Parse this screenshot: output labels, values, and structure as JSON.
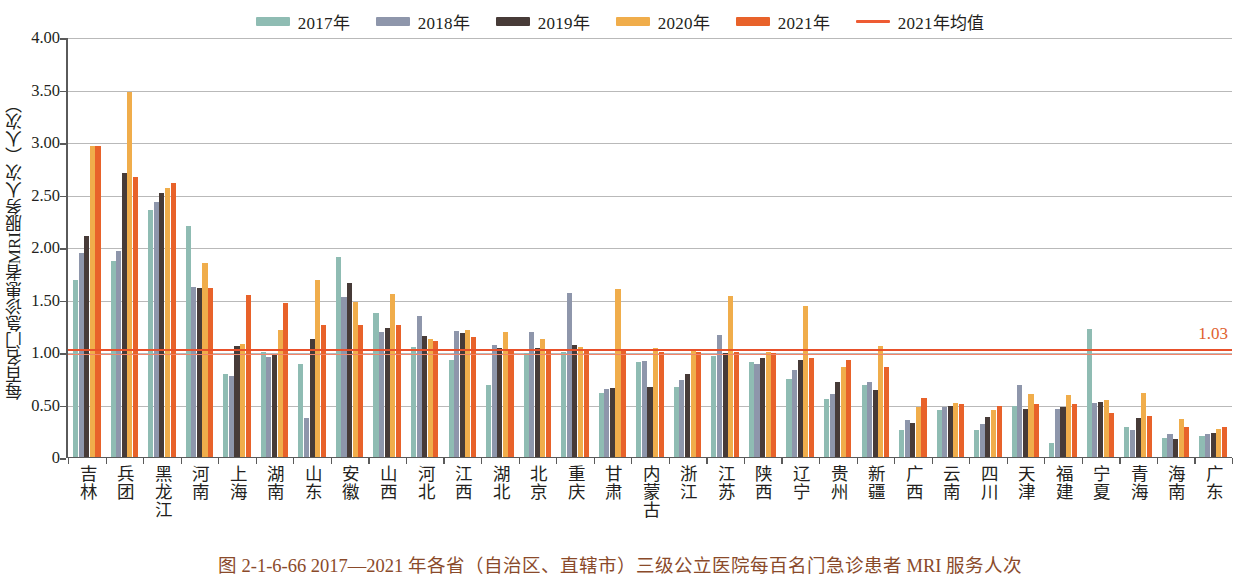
{
  "legend": {
    "items": [
      {
        "label": "2017年",
        "color": "#8fbcb3",
        "type": "bar"
      },
      {
        "label": "2018年",
        "color": "#8e96ab",
        "type": "bar"
      },
      {
        "label": "2019年",
        "color": "#473b38",
        "type": "bar"
      },
      {
        "label": "2020年",
        "color": "#f0ad4b",
        "type": "bar"
      },
      {
        "label": "2021年",
        "color": "#e8622a",
        "type": "bar"
      },
      {
        "label": "2021年均值",
        "color": "#ee5b33",
        "type": "line"
      }
    ]
  },
  "axes": {
    "y_title": "每百名门急诊患者MRI服务人次（人次）",
    "y_ticks": [
      "4.00",
      "3.50",
      "3.00",
      "2.50",
      "2.00",
      "1.50",
      "1.00",
      "0.50",
      "0"
    ],
    "y_min": 0,
    "y_max": 4.0,
    "grid": true
  },
  "average": {
    "value": 1.03,
    "label": "1.03",
    "color": "#e8502a"
  },
  "caption": {
    "text": "图 2-1-6-66   2017—2021 年各省（自治区、直辖市）三级公立医院每百名门急诊患者 MRI 服务人次"
  },
  "chart_data": {
    "type": "bar",
    "title": "图 2-1-6-66   2017—2021 年各省（自治区、直辖市）三级公立医院每百名门急诊患者 MRI 服务人次",
    "xlabel": "",
    "ylabel": "每百名门急诊患者MRI服务人次（人次）",
    "ylim": [
      0,
      4.0
    ],
    "ytick_step": 0.5,
    "grid": true,
    "legend_position": "top-center",
    "annotations": [
      {
        "text": "1.03",
        "type": "hline-label",
        "value": 1.03,
        "color": "#e8502a"
      }
    ],
    "categories": [
      "吉林",
      "兵团",
      "黑龙江",
      "河南",
      "上海",
      "湖南",
      "山东",
      "安徽",
      "山西",
      "河北",
      "江西",
      "湖北",
      "北京",
      "重庆",
      "甘肃",
      "内蒙古",
      "浙江",
      "江苏",
      "陕西",
      "辽宁",
      "贵州",
      "新疆",
      "广西",
      "云南",
      "四川",
      "天津",
      "福建",
      "宁夏",
      "青海",
      "海南",
      "广东"
    ],
    "series": [
      {
        "name": "2017年",
        "color": "#8fbcb3",
        "values": [
          1.7,
          1.88,
          2.36,
          2.21,
          0.8,
          1.01,
          0.9,
          1.91,
          1.38,
          1.06,
          0.93,
          0.7,
          1.0,
          1.01,
          0.62,
          0.91,
          0.68,
          0.97,
          0.91,
          0.75,
          0.56,
          0.7,
          0.27,
          0.46,
          0.27,
          0.5,
          0.14,
          1.23,
          0.3,
          0.19,
          0.21
        ]
      },
      {
        "name": "2018年",
        "color": "#8e96ab",
        "values": [
          1.95,
          1.97,
          2.44,
          1.63,
          0.78,
          0.96,
          0.38,
          1.53,
          1.2,
          1.35,
          1.21,
          1.08,
          1.2,
          1.57,
          0.66,
          0.92,
          0.74,
          1.17,
          0.9,
          0.84,
          0.61,
          0.72,
          0.36,
          0.49,
          0.32,
          0.7,
          0.47,
          0.52,
          0.27,
          0.23,
          0.23
        ]
      },
      {
        "name": "2019年",
        "color": "#473b38",
        "values": [
          2.11,
          2.71,
          2.52,
          1.62,
          1.07,
          0.98,
          1.13,
          1.67,
          1.24,
          1.16,
          1.19,
          1.05,
          1.05,
          1.08,
          0.67,
          0.68,
          0.8,
          1.0,
          0.95,
          0.93,
          0.72,
          0.65,
          0.33,
          0.5,
          0.39,
          0.47,
          0.49,
          0.53,
          0.38,
          0.18,
          0.24
        ]
      },
      {
        "name": "2020年",
        "color": "#f0ad4b",
        "values": [
          2.97,
          3.49,
          2.57,
          1.86,
          1.09,
          1.22,
          1.7,
          1.49,
          1.56,
          1.13,
          1.22,
          1.2,
          1.13,
          1.06,
          1.61,
          1.05,
          1.03,
          1.54,
          1.01,
          1.45,
          0.87,
          1.07,
          0.49,
          0.52,
          0.46,
          0.61,
          0.6,
          0.55,
          0.62,
          0.37,
          0.28
        ]
      },
      {
        "name": "2021年",
        "color": "#e8622a",
        "values": [
          2.97,
          2.68,
          2.62,
          1.62,
          1.55,
          1.48,
          1.27,
          1.27,
          1.27,
          1.11,
          1.15,
          1.02,
          1.02,
          1.04,
          1.02,
          1.01,
          1.01,
          1.01,
          1.0,
          0.95,
          0.93,
          0.87,
          0.57,
          0.51,
          0.5,
          0.51,
          0.51,
          0.43,
          0.4,
          0.3,
          0.3
        ]
      }
    ]
  }
}
